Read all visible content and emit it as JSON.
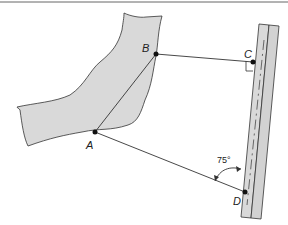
{
  "diagram": {
    "points": {
      "A": "A",
      "B": "B",
      "C": "C",
      "D": "D"
    },
    "angle_label": "75°",
    "angle_value_deg": 75,
    "right_angle_at": "C",
    "colors": {
      "body_fill": "#d9d9d9",
      "line": "#333333",
      "background": "#ffffff"
    }
  }
}
